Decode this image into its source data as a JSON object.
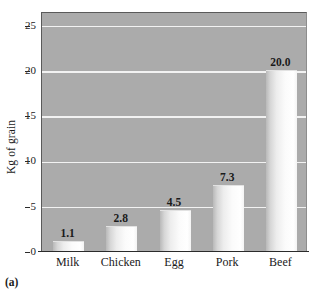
{
  "caption": "(a)",
  "chart_data": {
    "type": "bar",
    "title": "",
    "xlabel": "",
    "ylabel": "Kg of grain",
    "categories": [
      "Milk",
      "Chicken",
      "Egg",
      "Pork",
      "Beef"
    ],
    "values": [
      1.1,
      2.8,
      4.5,
      7.3,
      20.0
    ],
    "value_labels": [
      "1.1",
      "2.8",
      "4.5",
      "7.3",
      "20.0"
    ],
    "ylim": [
      0,
      26.5
    ],
    "yticks": [
      0,
      5,
      10,
      15,
      20,
      25
    ],
    "ytick_labels": [
      "0",
      "5",
      "10",
      "15",
      "20",
      "25"
    ],
    "grid": true,
    "gridlines_at": [
      5,
      10,
      15,
      20,
      25
    ],
    "legend": null,
    "legend_position": "none",
    "plot_background": "#ababab",
    "gridline_color": "#f2f2f2",
    "bar_color": "#f2f2f2",
    "axis_color": "#2b2b2b"
  }
}
